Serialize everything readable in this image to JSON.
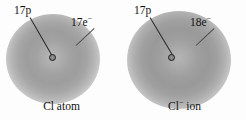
{
  "figure": {
    "background_color": "#fdfdfd",
    "width": 246,
    "height": 120
  },
  "panels": [
    {
      "id": "chlorine-atom",
      "caption": "Cl atom",
      "caption_base": "Cl atom",
      "caption_superscript": "",
      "proton_label": "17p",
      "electron_label_base": "17e",
      "electron_label_superscript": "−",
      "electron_label": "17e−",
      "protons": 17,
      "electrons": 17,
      "charge": "0",
      "cloud_color_center": "#b9b9b9",
      "cloud_color_mid": "#9d9d9d",
      "nucleus_color": "#1a1a1a"
    },
    {
      "id": "chloride-ion",
      "caption": "Cl− ion",
      "caption_base": "Cl",
      "caption_superscript": "−",
      "caption_tail": " ion",
      "proton_label": "17p",
      "electron_label_base": "18e",
      "electron_label_superscript": "−",
      "electron_label": "18e−",
      "protons": 17,
      "electrons": 18,
      "charge": "−1",
      "cloud_color_center": "#b5b5b5",
      "cloud_color_mid": "#999999",
      "nucleus_color": "#1a1a1a"
    }
  ]
}
